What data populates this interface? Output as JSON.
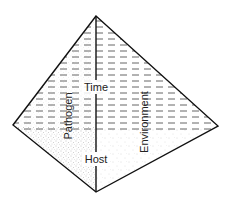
{
  "diagram": {
    "type": "disease-pyramid",
    "labels": {
      "apex_axis": "Time",
      "left_face": "Pathogen",
      "right_face": "Environment",
      "base_axis": "Host"
    },
    "vertices": {
      "apex": [
        96,
        16
      ],
      "left": [
        13,
        125
      ],
      "right": [
        218,
        126
      ],
      "bottom": [
        96,
        192
      ]
    },
    "colors": {
      "line": "#111111",
      "dash_hatch": "#555555",
      "stipple_left": "#9a9a9a",
      "stipple_right": "#bbbbbb",
      "background": "#ffffff"
    }
  }
}
